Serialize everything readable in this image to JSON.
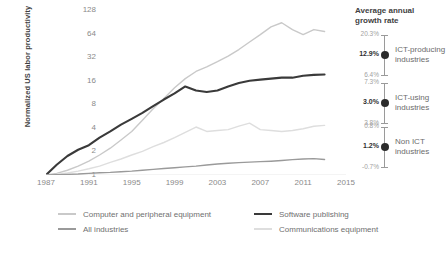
{
  "chart_data": {
    "type": "line",
    "title": "",
    "xlabel": "",
    "ylabel": "Normalized US labor productivity",
    "yscale": "log2",
    "ylim": [
      1,
      128
    ],
    "ytick_labels": [
      "1",
      "2",
      "4",
      "8",
      "16",
      "32",
      "64",
      "128"
    ],
    "ytick_values": [
      1,
      2,
      4,
      8,
      16,
      32,
      64,
      128
    ],
    "xtick_labels": [
      "1987",
      "1991",
      "1995",
      "1999",
      "2003",
      "2007",
      "2011",
      "2015"
    ],
    "xlim": [
      1987,
      2015
    ],
    "grid": false,
    "legend_position": "bottom",
    "x": [
      1987,
      1988,
      1989,
      1990,
      1991,
      1992,
      1993,
      1994,
      1995,
      1996,
      1997,
      1998,
      1999,
      2000,
      2001,
      2002,
      2003,
      2004,
      2005,
      2006,
      2007,
      2008,
      2009,
      2010,
      2011,
      2012,
      2013
    ],
    "series": [
      {
        "name": "Computer and peripheral equipment",
        "color": "#c9c9c9",
        "values": [
          1.0,
          1.05,
          1.15,
          1.3,
          1.5,
          1.8,
          2.2,
          2.8,
          3.6,
          5.0,
          7.0,
          9.5,
          13.0,
          17.0,
          21.0,
          24.0,
          28.0,
          33.0,
          40.0,
          50.0,
          62.0,
          78.0,
          88.0,
          72.0,
          62.0,
          72.0,
          68.0
        ]
      },
      {
        "name": "Software publishing",
        "color": "#3a3a3a",
        "values": [
          1.0,
          1.35,
          1.75,
          2.1,
          2.4,
          3.0,
          3.6,
          4.4,
          5.2,
          6.2,
          7.6,
          9.2,
          11.0,
          13.5,
          12.0,
          11.5,
          12.0,
          13.5,
          15.0,
          16.0,
          16.5,
          17.0,
          17.5,
          17.5,
          18.5,
          19.0,
          19.2
        ]
      },
      {
        "name": "Communications equipment",
        "color": "#dedede",
        "values": [
          1.0,
          1.02,
          1.06,
          1.12,
          1.2,
          1.3,
          1.45,
          1.6,
          1.8,
          2.0,
          2.3,
          2.6,
          3.0,
          3.5,
          4.1,
          3.6,
          3.7,
          3.8,
          4.2,
          4.6,
          3.8,
          3.7,
          3.6,
          3.7,
          3.9,
          4.2,
          4.3
        ]
      },
      {
        "name": "All industries",
        "color": "#9a9a9a",
        "values": [
          1.0,
          1.01,
          1.02,
          1.03,
          1.05,
          1.07,
          1.08,
          1.1,
          1.12,
          1.15,
          1.18,
          1.21,
          1.24,
          1.27,
          1.3,
          1.34,
          1.38,
          1.41,
          1.44,
          1.46,
          1.48,
          1.5,
          1.53,
          1.57,
          1.6,
          1.62,
          1.58
        ]
      }
    ]
  },
  "y_axis_title": "Normalized US labor productivity",
  "panel": {
    "title_line1": "Average annual",
    "title_line2": "growth rate",
    "groups": [
      {
        "name_line1": "ICT-producing",
        "name_line2": "industries",
        "upper": "20.3%",
        "mean": "12.9%",
        "lower": "6.4%"
      },
      {
        "name_line1": "ICT-using",
        "name_line2": "industries",
        "upper": "7.3%",
        "mean": "3.0%",
        "lower": "3.8%"
      },
      {
        "name_line1": "Non ICT",
        "name_line2": "industries",
        "upper": "0.8%",
        "mean": "1.2%",
        "lower": "-0.7%"
      }
    ]
  },
  "legend": [
    {
      "label": "Computer and peripheral equipment",
      "color": "#c9c9c9"
    },
    {
      "label": "All industries",
      "color": "#9a9a9a"
    },
    {
      "label": "Software publishing",
      "color": "#3a3a3a"
    },
    {
      "label": "Communications equipment",
      "color": "#dedede"
    }
  ]
}
